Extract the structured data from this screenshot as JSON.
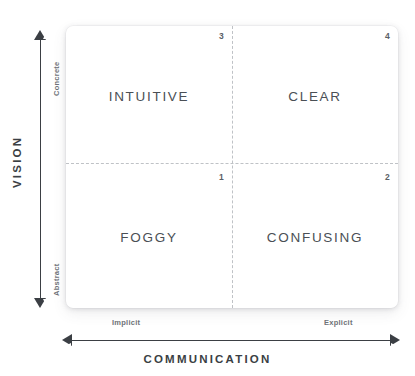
{
  "chart_data": {
    "type": "table",
    "xlabel": "COMMUNICATION",
    "ylabel": "VISION",
    "x_axis": {
      "title": "COMMUNICATION",
      "low_label": "Implicit",
      "high_label": "Explicit",
      "arrows": "both"
    },
    "y_axis": {
      "title": "VISION",
      "low_label": "Abstract",
      "high_label": "Concrete",
      "arrows": "both"
    },
    "grid": "dashed-crosshair",
    "legend": "none",
    "quadrants": [
      {
        "number": "1",
        "label": "FOGGY",
        "position": "bottom-left",
        "vision": "Abstract",
        "communication": "Implicit"
      },
      {
        "number": "2",
        "label": "CONFUSING",
        "position": "bottom-right",
        "vision": "Abstract",
        "communication": "Explicit"
      },
      {
        "number": "3",
        "label": "INTUITIVE",
        "position": "top-left",
        "vision": "Concrete",
        "communication": "Implicit"
      },
      {
        "number": "4",
        "label": "CLEAR",
        "position": "top-right",
        "vision": "Concrete",
        "communication": "Explicit"
      }
    ],
    "colors": {
      "background": "#ffffff",
      "card": "#ffffff",
      "axis": "#3b3f44",
      "divider": "#bfc2c6",
      "quadrant_text": "#4a4f55",
      "tick_text": "#6e7277"
    }
  },
  "quadrants": {
    "top_left": {
      "label": "INTUITIVE",
      "number": "3"
    },
    "top_right": {
      "label": "CLEAR",
      "number": "4"
    },
    "bottom_left": {
      "label": "FOGGY",
      "number": "1"
    },
    "bottom_right": {
      "label": "CONFUSING",
      "number": "2"
    }
  },
  "axes": {
    "y": {
      "title": "VISION",
      "high": "Concrete",
      "low": "Abstract"
    },
    "x": {
      "title": "COMMUNICATION",
      "low": "Implicit",
      "high": "Explicit"
    }
  }
}
